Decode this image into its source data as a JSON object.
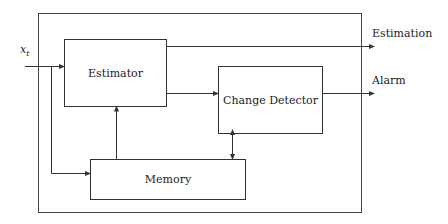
{
  "diagram": {
    "input": {
      "label": "x",
      "subscript": "t"
    },
    "blocks": {
      "estimator": {
        "label": "Estimator"
      },
      "change_detector": {
        "label": "Change Detector"
      },
      "memory": {
        "label": "Memory"
      }
    },
    "outputs": {
      "estimation": {
        "label": "Estimation"
      },
      "alarm": {
        "label": "Alarm"
      }
    },
    "colors": {
      "stroke": "#333333",
      "text": "#222222",
      "background": "#ffffff"
    }
  }
}
